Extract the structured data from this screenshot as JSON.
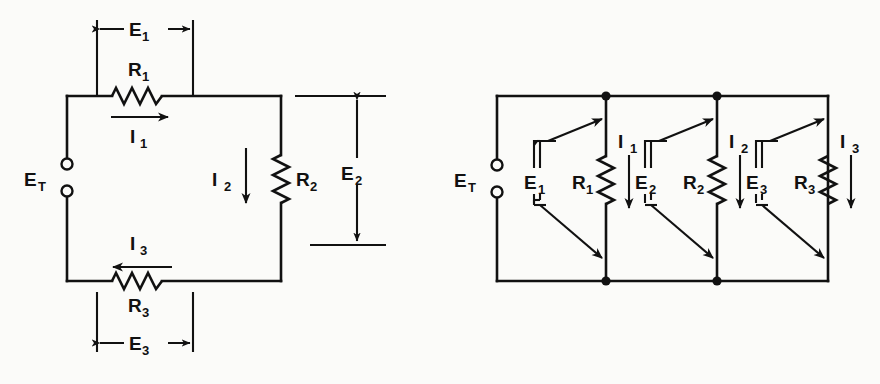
{
  "figure": {
    "background_color": "#fbfbf9",
    "ink_color": "#111111",
    "type": "electrical-circuit-diagram"
  },
  "series_circuit": {
    "name": "series-circuit",
    "source_label": "E",
    "source_subscript": "T",
    "dimensions": [
      {
        "id": "E1",
        "label": "E",
        "subscript": "1",
        "orientation": "horizontal",
        "position": "top"
      },
      {
        "id": "E2",
        "label": "E",
        "subscript": "2",
        "orientation": "vertical",
        "position": "right"
      },
      {
        "id": "E3",
        "label": "E",
        "subscript": "3",
        "orientation": "horizontal",
        "position": "bottom"
      }
    ],
    "resistors": [
      {
        "id": "R1",
        "label": "R",
        "subscript": "1",
        "orientation": "horizontal",
        "position": "top"
      },
      {
        "id": "R2",
        "label": "R",
        "subscript": "2",
        "orientation": "vertical",
        "position": "right"
      },
      {
        "id": "R3",
        "label": "R",
        "subscript": "3",
        "orientation": "horizontal",
        "position": "bottom"
      }
    ],
    "currents": [
      {
        "id": "I1",
        "label": "I",
        "subscript": "1",
        "direction": "right"
      },
      {
        "id": "I2",
        "label": "I",
        "subscript": "2",
        "direction": "down"
      },
      {
        "id": "I3",
        "label": "I",
        "subscript": "3",
        "direction": "left"
      }
    ]
  },
  "parallel_circuit": {
    "name": "parallel-circuit",
    "source_label": "E",
    "source_subscript": "T",
    "branches": [
      {
        "index": 1,
        "voltage": {
          "label": "E",
          "subscript": "1"
        },
        "resistor": {
          "label": "R",
          "subscript": "1"
        },
        "current": {
          "label": "I",
          "subscript": "1",
          "direction": "down"
        },
        "has_node_dots": true
      },
      {
        "index": 2,
        "voltage": {
          "label": "E",
          "subscript": "2"
        },
        "resistor": {
          "label": "R",
          "subscript": "2"
        },
        "current": {
          "label": "I",
          "subscript": "2",
          "direction": "down"
        },
        "has_node_dots": true
      },
      {
        "index": 3,
        "voltage": {
          "label": "E",
          "subscript": "3"
        },
        "resistor": {
          "label": "R",
          "subscript": "3"
        },
        "current": {
          "label": "I",
          "subscript": "3",
          "direction": "down"
        },
        "has_node_dots": false
      }
    ]
  }
}
